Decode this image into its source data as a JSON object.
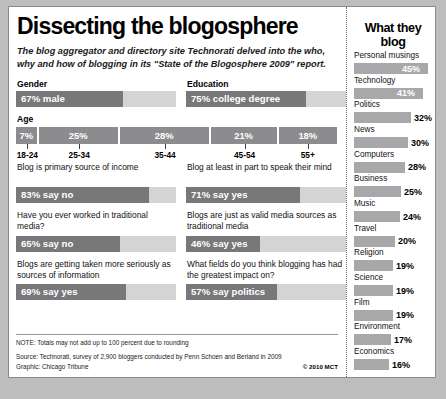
{
  "title": "Dissecting the blogosphere",
  "subtitle": "The blog aggregator and directory site Technorati delved into the who, why and how of blogging in its \"State of the Blogosphere 2009\" report.",
  "colors": {
    "bar_fill": "#78787b",
    "bar_track": "#d4d4d4",
    "age_segment": "#8c8c8f",
    "sidebar_bar": "#a8a8ab",
    "page_background": "#bdbdbd",
    "card_background": "#ffffff"
  },
  "gender": {
    "label": "Gender",
    "bar_text": "67% male",
    "value": 67
  },
  "education": {
    "label": "Education",
    "bar_text": "75% college degree",
    "value": 75
  },
  "age": {
    "label": "Age",
    "segments": [
      {
        "pct_label": "7%",
        "value": 7,
        "range": "18-24"
      },
      {
        "pct_label": "25%",
        "value": 25,
        "range": "25-34"
      },
      {
        "pct_label": "28%",
        "value": 28,
        "range": "35-44"
      },
      {
        "pct_label": "21%",
        "value": 21,
        "range": "45-54"
      },
      {
        "pct_label": "18%",
        "value": 18,
        "range": "55+"
      }
    ]
  },
  "questions": [
    {
      "question": "Blog is primary source of income",
      "bar_text": "83% say no",
      "value": 83
    },
    {
      "question": "Blog at least in part to speak their mind",
      "bar_text": "71% say yes",
      "value": 71
    },
    {
      "question": "Have you ever worked in traditional media?",
      "bar_text": "65% say no",
      "value": 65
    },
    {
      "question": "Blogs are just as valid media sources as traditional media",
      "bar_text": "46% say yes",
      "value": 46
    },
    {
      "question": "Blogs are getting taken more seriously as sources of information",
      "bar_text": "69% say yes",
      "value": 69
    },
    {
      "question": "What fields do you think blogging has had the greatest impact on?",
      "bar_text": "57% say politics",
      "value": 57
    }
  ],
  "footer": {
    "note": "NOTE: Totals may not add up to 100 percent due to rounding",
    "source": "Source: Technorati, survey of 2,900 bloggers conducted by Penn Schoen and Berland in 2009",
    "graphic": "Graphic: Chicago Tribune",
    "credit": "© 2010 MCT"
  },
  "sidebar": {
    "title": "What they blog",
    "items": [
      {
        "name": "Personal musings",
        "pct_label": "45%",
        "value": 45
      },
      {
        "name": "Technology",
        "pct_label": "41%",
        "value": 41
      },
      {
        "name": "Politics",
        "pct_label": "32%",
        "value": 32
      },
      {
        "name": "News",
        "pct_label": "30%",
        "value": 30
      },
      {
        "name": "Computers",
        "pct_label": "28%",
        "value": 28
      },
      {
        "name": "Business",
        "pct_label": "25%",
        "value": 25
      },
      {
        "name": "Music",
        "pct_label": "24%",
        "value": 24
      },
      {
        "name": "Travel",
        "pct_label": "20%",
        "value": 20
      },
      {
        "name": "Religion",
        "pct_label": "19%",
        "value": 19
      },
      {
        "name": "Science",
        "pct_label": "19%",
        "value": 19
      },
      {
        "name": "Film",
        "pct_label": "19%",
        "value": 19
      },
      {
        "name": "Environment",
        "pct_label": "17%",
        "value": 17
      },
      {
        "name": "Economics",
        "pct_label": "16%",
        "value": 16
      }
    ]
  },
  "chart_data": [
    {
      "type": "bar",
      "title": "Gender",
      "categories": [
        "67% male"
      ],
      "values": [
        67
      ],
      "xlabel": "",
      "ylabel": "percent",
      "ylim": [
        0,
        100
      ]
    },
    {
      "type": "bar",
      "title": "Education",
      "categories": [
        "75% college degree"
      ],
      "values": [
        75
      ],
      "xlabel": "",
      "ylabel": "percent",
      "ylim": [
        0,
        100
      ]
    },
    {
      "type": "bar",
      "title": "Age",
      "categories": [
        "18-24",
        "25-34",
        "35-44",
        "45-54",
        "55+"
      ],
      "values": [
        7,
        25,
        28,
        21,
        18
      ],
      "xlabel": "Age group",
      "ylabel": "percent of bloggers",
      "ylim": [
        0,
        100
      ]
    },
    {
      "type": "bar",
      "title": "Survey responses",
      "categories": [
        "Blog is primary source of income",
        "Blog at least in part to speak their mind",
        "Have you ever worked in traditional media?",
        "Blogs are just as valid media sources as traditional media",
        "Blogs are getting taken more seriously as sources of information",
        "What fields do you think blogging has had the greatest impact on?"
      ],
      "values": [
        83,
        71,
        65,
        46,
        69,
        57
      ],
      "value_labels": [
        "83% say no",
        "71% say yes",
        "65% say no",
        "46% say yes",
        "69% say yes",
        "57% say politics"
      ],
      "xlabel": "",
      "ylabel": "percent",
      "ylim": [
        0,
        100
      ]
    },
    {
      "type": "bar",
      "title": "What they blog",
      "categories": [
        "Personal musings",
        "Technology",
        "Politics",
        "News",
        "Computers",
        "Business",
        "Music",
        "Travel",
        "Religion",
        "Science",
        "Film",
        "Environment",
        "Economics"
      ],
      "values": [
        45,
        41,
        32,
        30,
        28,
        25,
        24,
        20,
        19,
        19,
        19,
        17,
        16
      ],
      "xlabel": "percent of bloggers",
      "ylabel": "topic",
      "ylim": [
        0,
        50
      ],
      "grid": false,
      "legend": "none"
    }
  ]
}
